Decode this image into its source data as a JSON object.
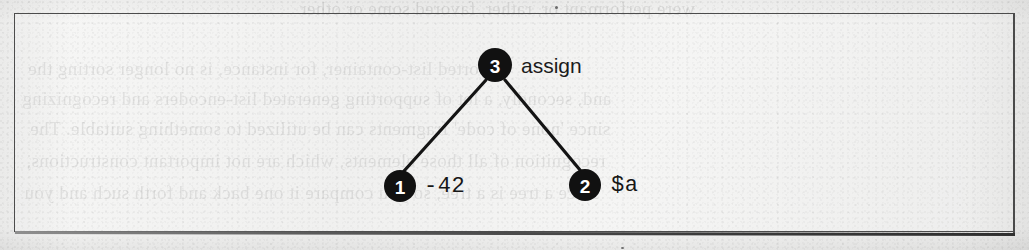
{
  "page": {
    "type": "scanned-book-figure",
    "background_color": "#f2f2f1",
    "ink_color": "#111111",
    "frame": {
      "border_color": "#4c4c4c",
      "x": 14,
      "y": 13,
      "width": 1001,
      "height": 219
    }
  },
  "figure": {
    "caption": "",
    "diagram_kind": "parse-tree",
    "nodes": [
      {
        "id": "3",
        "number": "3",
        "label": "assign",
        "label_font": "sans",
        "cx": 495,
        "cy": 65,
        "r": 17
      },
      {
        "id": "1",
        "number": "1",
        "label": "-42",
        "label_font": "mono",
        "cx": 400,
        "cy": 186,
        "r": 16
      },
      {
        "id": "2",
        "number": "2",
        "label": "$a",
        "label_font": "mono",
        "cx": 585,
        "cy": 185,
        "r": 16
      }
    ],
    "edges": [
      {
        "from": "3",
        "to": "1"
      },
      {
        "from": "3",
        "to": "2"
      }
    ]
  },
  "bleed_through_text": {
    "description": "faint mirrored text showing through from the reverse side of the page",
    "lines": [
      "were performant or, rather, favored some or other",
      "A sorted list-container, for instance, is no longer sorting the",
      "and, secondly, a lot of supporting generated list-encoders and recognizing",
      "since 'none of code' fragments can be utilized to something suitable. The",
      "recognition of all those elements, which are not important constructions,",
      "since a tree is a tree, so you compare it one back and forth such and you"
    ]
  },
  "colors": {
    "ink": "#111111",
    "frame": "#4c4c4c",
    "paper": "#f2f2f1",
    "node_number": "#ffffff"
  }
}
